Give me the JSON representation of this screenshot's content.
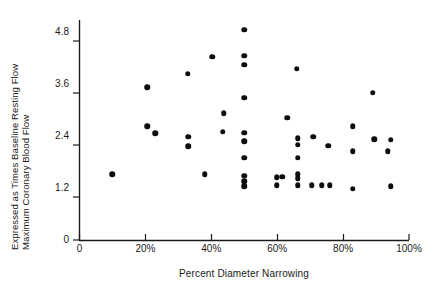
{
  "chart_data": {
    "type": "scatter",
    "title": "",
    "xlabel": "Percent Diameter Narrowing",
    "ylabel_line1": "Maximum Coronary Blood Flow",
    "ylabel_line2": "Expressed as Times Baseline Resting Flow",
    "xlim": [
      0,
      100
    ],
    "ylim": [
      0,
      5.3
    ],
    "grid": false,
    "legend": "none",
    "xticks": [
      {
        "value": 0,
        "label": "0"
      },
      {
        "value": 20,
        "label": "20%"
      },
      {
        "value": 40,
        "label": "40%"
      },
      {
        "value": 60,
        "label": "60%"
      },
      {
        "value": 80,
        "label": "80%"
      },
      {
        "value": 100,
        "label": "100%"
      }
    ],
    "yticks": [
      {
        "value": 0,
        "label": "0"
      },
      {
        "value": 1.2,
        "label": "1.2"
      },
      {
        "value": 2.4,
        "label": "2.4"
      },
      {
        "value": 3.6,
        "label": "3.6"
      },
      {
        "value": 4.8,
        "label": "4.8"
      }
    ],
    "marker": {
      "shape": "circle",
      "color": "#0d0d0d",
      "size_px": 5.5
    },
    "points": [
      {
        "x": 10,
        "y": 1.52
      },
      {
        "x": 20.5,
        "y": 3.52
      },
      {
        "x": 20.5,
        "y": 2.62
      },
      {
        "x": 23.0,
        "y": 2.46
      },
      {
        "x": 32.8,
        "y": 3.84
      },
      {
        "x": 33.0,
        "y": 2.38
      },
      {
        "x": 33.0,
        "y": 2.16
      },
      {
        "x": 38.0,
        "y": 1.52
      },
      {
        "x": 40.3,
        "y": 4.23
      },
      {
        "x": 43.8,
        "y": 2.92
      },
      {
        "x": 43.5,
        "y": 2.5
      },
      {
        "x": 50.0,
        "y": 4.85
      },
      {
        "x": 50.0,
        "y": 4.25
      },
      {
        "x": 50.0,
        "y": 4.05
      },
      {
        "x": 50.0,
        "y": 3.28
      },
      {
        "x": 50.0,
        "y": 2.48
      },
      {
        "x": 50.0,
        "y": 2.28
      },
      {
        "x": 50.0,
        "y": 1.9
      },
      {
        "x": 50.0,
        "y": 1.48
      },
      {
        "x": 50.0,
        "y": 1.36
      },
      {
        "x": 50.0,
        "y": 1.24
      },
      {
        "x": 59.8,
        "y": 1.45
      },
      {
        "x": 59.8,
        "y": 1.26
      },
      {
        "x": 61.5,
        "y": 1.46
      },
      {
        "x": 63.0,
        "y": 2.82
      },
      {
        "x": 66.0,
        "y": 3.95
      },
      {
        "x": 66.2,
        "y": 2.35
      },
      {
        "x": 66.2,
        "y": 2.2
      },
      {
        "x": 66.2,
        "y": 1.9
      },
      {
        "x": 66.2,
        "y": 1.52
      },
      {
        "x": 66.2,
        "y": 1.42
      },
      {
        "x": 66.2,
        "y": 1.26
      },
      {
        "x": 71.0,
        "y": 2.38
      },
      {
        "x": 70.5,
        "y": 1.26
      },
      {
        "x": 73.5,
        "y": 1.26
      },
      {
        "x": 75.5,
        "y": 2.18
      },
      {
        "x": 76.0,
        "y": 1.26
      },
      {
        "x": 83.0,
        "y": 2.62
      },
      {
        "x": 83.0,
        "y": 2.05
      },
      {
        "x": 83.0,
        "y": 1.18
      },
      {
        "x": 89.0,
        "y": 3.4
      },
      {
        "x": 89.5,
        "y": 2.32
      },
      {
        "x": 93.5,
        "y": 2.05
      },
      {
        "x": 94.5,
        "y": 2.31
      },
      {
        "x": 94.5,
        "y": 1.24
      }
    ]
  }
}
